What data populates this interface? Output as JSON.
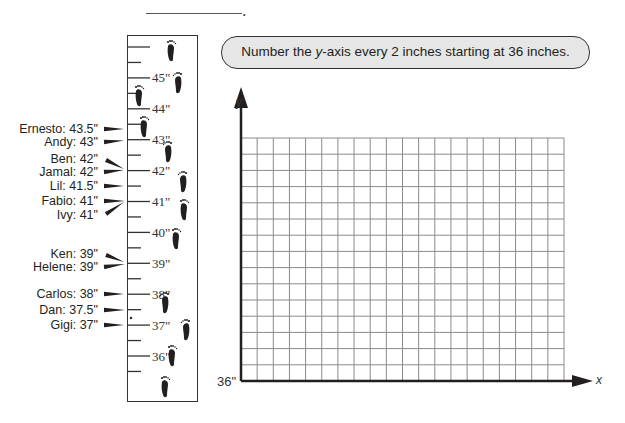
{
  "header": {
    "name_blank": ""
  },
  "instruction": {
    "prefix": "Number the ",
    "variable": "y",
    "suffix": "-axis every 2 inches starting at 36 inches."
  },
  "ruler": {
    "unit": "inches",
    "major_labels": [
      "45\"",
      "44\"",
      "43\"",
      "42\"",
      "41\"",
      "40\"",
      "39\"",
      "38\"",
      "37\"",
      "36\""
    ],
    "major_values": [
      45,
      44,
      43,
      42,
      41,
      40,
      39,
      38,
      37,
      36
    ],
    "minor_tick_interval": 0.25
  },
  "students": [
    {
      "name": "Ernesto",
      "height": 43.5,
      "label": "Ernesto: 43.5\""
    },
    {
      "name": "Andy",
      "height": 43,
      "label": "Andy: 43\""
    },
    {
      "name": "Ben",
      "height": 42,
      "label": "Ben: 42\""
    },
    {
      "name": "Jamal",
      "height": 42,
      "label": "Jamal: 42\""
    },
    {
      "name": "Lil",
      "height": 41.5,
      "label": "Lil: 41.5\""
    },
    {
      "name": "Fabio",
      "height": 41,
      "label": "Fabio: 41\""
    },
    {
      "name": "Ivy",
      "height": 41,
      "label": "Ivy: 41\""
    },
    {
      "name": "Ken",
      "height": 39,
      "label": "Ken: 39\""
    },
    {
      "name": "Helene",
      "height": 39,
      "label": "Helene: 39\""
    },
    {
      "name": "Carlos",
      "height": 38,
      "label": "Carlos: 38\""
    },
    {
      "name": "Dan",
      "height": 37.5,
      "label": "Dan: 37.5\""
    },
    {
      "name": "Gigi",
      "height": 37,
      "label": "Gigi: 37\""
    }
  ],
  "graph": {
    "x_axis_label": "x",
    "y_axis_label": "y",
    "y_start_label": "36\"",
    "columns": 20,
    "rows": 15
  },
  "chart_data": {
    "type": "table",
    "categories": [
      "Ernesto",
      "Andy",
      "Ben",
      "Jamal",
      "Lil",
      "Fabio",
      "Ivy",
      "Ken",
      "Helene",
      "Carlos",
      "Dan",
      "Gigi"
    ],
    "values": [
      43.5,
      43,
      42,
      42,
      41.5,
      41,
      41,
      39,
      39,
      38,
      37.5,
      37
    ],
    "xlabel": "x",
    "ylabel": "y",
    "y_start": 36,
    "y_tick_step_instruction": 2,
    "grid": {
      "columns": 20,
      "rows": 15,
      "on": true
    },
    "ruler_range": [
      36,
      45
    ]
  },
  "colors": {
    "ink": "#231f20",
    "grid_line": "#8a8a8a",
    "instruction_fill": "#e6e6e6"
  }
}
